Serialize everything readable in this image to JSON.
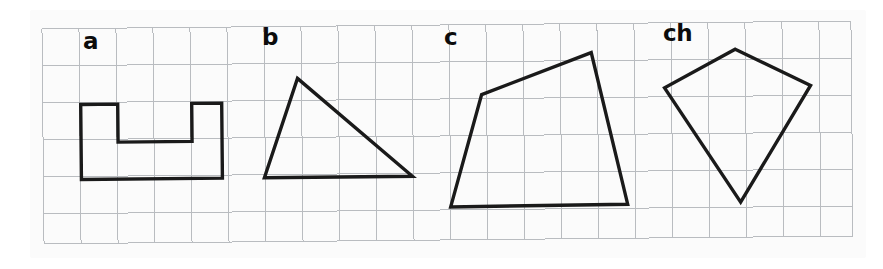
{
  "worksheet": {
    "title": "Geometric shapes on grid paper",
    "background_color": "#ffffff",
    "paper_color": "#fbfbfb",
    "grid_line_color": "#b9bcc0",
    "shape_stroke_color": "#1a1a1a",
    "label_color": "#0c0c0c",
    "width": 883,
    "height": 269
  },
  "grid": {
    "name": "square-grid",
    "origin_x": 43,
    "origin_y": 25,
    "cell_size": 37,
    "columns": 22,
    "rows": 6,
    "right_edge": 852,
    "bottom_edge": 240,
    "line_width": 1
  },
  "labels": {
    "a": "a",
    "b": "b",
    "c": "c",
    "ch": "ch"
  },
  "shapes": [
    {
      "id": "a",
      "label": "a",
      "name": "u-shape-hexagon",
      "description": "U-shaped octagon: rectangle with a rectangular notch cut from the top edge",
      "vertex_count": 8,
      "points": "81,101 118,101 118,139 192,139 192,101 222,101 222,176 81,176",
      "stroke_width": 3.4,
      "closed": true
    },
    {
      "id": "b",
      "label": "b",
      "name": "scalene-triangle",
      "description": "Scalene triangle with apex up-left and a long horizontal base",
      "vertex_count": 3,
      "points": "298,77 412,176 264,176",
      "stroke_width": 3.4,
      "closed": true
    },
    {
      "id": "c",
      "label": "c",
      "name": "irregular-quadrilateral",
      "description": "Irregular convex quadrilateral, tallest on the right side",
      "vertex_count": 4,
      "points": "482,95 592,54 627,206 450,207",
      "stroke_width": 3.4,
      "closed": true
    },
    {
      "id": "ch",
      "label": "ch",
      "name": "kite-quadrilateral",
      "description": "Kite-shaped quadrilateral with a short top vertex and a long bottom point",
      "vertex_count": 4,
      "points": "736,52 811,89 740,205 665,90",
      "stroke_width": 3.4,
      "closed": true
    }
  ]
}
